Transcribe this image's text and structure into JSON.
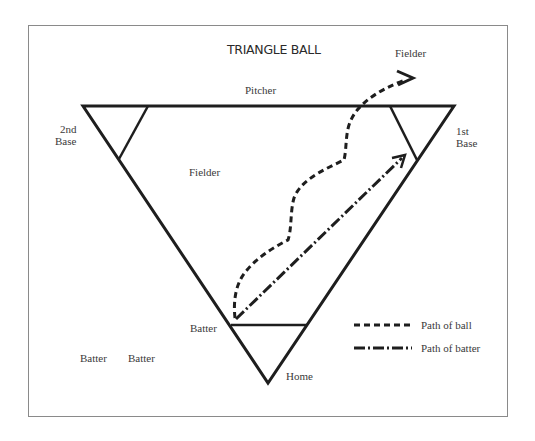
{
  "title": "TRIANGLE BALL",
  "labels": {
    "fielder_top": "Fielder",
    "pitcher": "Pitcher",
    "second_base_line1": "2nd",
    "second_base_line2": "Base",
    "first_base_line1": "1st",
    "first_base_line2": "Base",
    "fielder_middle": "Fielder",
    "batter_at_plate": "Batter",
    "batter_waiting_1": "Batter",
    "batter_waiting_2": "Batter",
    "home": "Home"
  },
  "legend": [
    {
      "style": "dashed",
      "label": "Path of ball"
    },
    {
      "style": "dash-dot",
      "label": "Path of batter"
    }
  ],
  "colors": {
    "line": "#1e1e1e",
    "text": "#3a3a3a",
    "frame": "#8a8a8a"
  }
}
